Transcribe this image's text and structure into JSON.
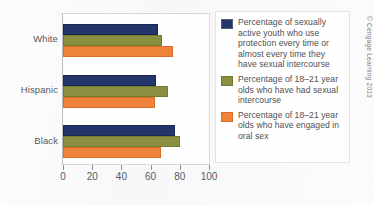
{
  "chart_data": {
    "type": "bar",
    "orientation": "horizontal",
    "title": "",
    "xlabel": "",
    "ylabel": "",
    "categories": [
      "White",
      "Hispanic",
      "Black"
    ],
    "xlim": [
      0,
      100
    ],
    "xticks": [
      0,
      20,
      40,
      60,
      80,
      100
    ],
    "xticklabels": [
      "0",
      "20",
      "40",
      "60",
      "80",
      "100"
    ],
    "grid": false,
    "legend_position": "right",
    "series": [
      {
        "name": "Percentage of sexually active youth who use protection every time or almost every time they have sexual intercourse",
        "color": "#24356C",
        "values": [
          65,
          64,
          77
        ]
      },
      {
        "name": "Percentage of 18–21 year olds who have had sexual intercourse",
        "color": "#8B9040",
        "values": [
          68,
          72,
          80
        ]
      },
      {
        "name": "Percentage of 18–21 year olds who have engaged in oral sex",
        "color": "#F0833A",
        "values": [
          75,
          63,
          67
        ]
      }
    ]
  },
  "legend": {
    "entries": [
      {
        "swatch": "navy-swatch",
        "label": "Percentage of sexually active youth who use protection every time or almost every time they have sexual intercourse"
      },
      {
        "swatch": "olive-swatch",
        "label": "Percentage of 18–21 year olds who have had sexual intercourse"
      },
      {
        "swatch": "orange-swatch",
        "label": "Percentage of 18–21 year olds who have engaged in oral sex"
      }
    ]
  },
  "credit": {
    "text": "© Cengage Learning 2013"
  }
}
